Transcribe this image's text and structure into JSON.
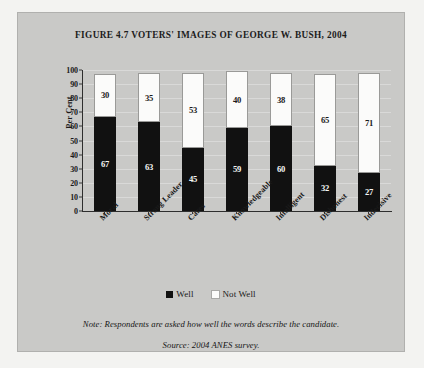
{
  "figure": {
    "title": "FIGURE 4.7 VOTERS' IMAGES OF GEORGE W. BUSH, 2004",
    "note": "Note: Respondents are asked how well the words describe the candidate.",
    "source": "Source: 2004 ANES survey."
  },
  "legend": {
    "items": [
      {
        "label": "Well",
        "color": "#111111"
      },
      {
        "label": "Not Well",
        "color": "#fbfbfa"
      }
    ]
  },
  "chart_data": {
    "type": "bar",
    "subtype": "stacked",
    "title": "FIGURE 4.7 VOTERS' IMAGES OF GEORGE W. BUSH, 2004",
    "xlabel": "",
    "ylabel": "Per Cent",
    "ylim": [
      0,
      100
    ],
    "yticks": [
      0,
      10,
      20,
      30,
      40,
      50,
      60,
      70,
      80,
      90,
      100
    ],
    "ytick_labels": [
      "0",
      "10",
      "20",
      "30",
      "40",
      "50",
      "60",
      "70",
      "80",
      "90",
      "100"
    ],
    "grid": true,
    "legend_position": "bottom",
    "categories": [
      "Moral",
      "Strong Leader",
      "Cares",
      "Knowledgeable",
      "Intelligent",
      "Dishonest",
      "Indecisive"
    ],
    "series": [
      {
        "name": "Well",
        "color": "#111111",
        "values": [
          67,
          63,
          45,
          59,
          60,
          32,
          27
        ]
      },
      {
        "name": "Not Well",
        "color": "#fbfbfa",
        "values": [
          30,
          35,
          53,
          40,
          38,
          65,
          71
        ]
      }
    ]
  }
}
